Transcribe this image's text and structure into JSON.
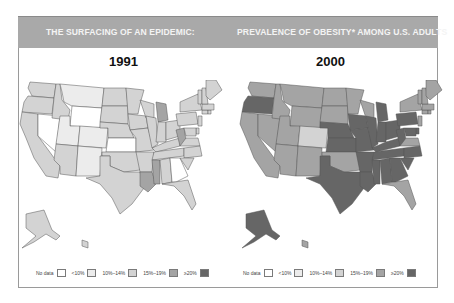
{
  "header": {
    "left_title": "THE SURFACING OF AN EPIDEMIC:",
    "right_title": "PREVALENCE OF OBESITY* AMONG U.S. ADULTS"
  },
  "colors": {
    "nodata": "#ffffff",
    "lt10": "#ececec",
    "p10_14": "#d3d3d3",
    "p15_19": "#a4a4a4",
    "ge20": "#666666"
  },
  "legend": [
    {
      "label": "No data",
      "key": "nodata"
    },
    {
      "label": "<10%",
      "key": "lt10"
    },
    {
      "label": "10%–14%",
      "key": "p10_14"
    },
    {
      "label": "15%–19%",
      "key": "p15_19"
    },
    {
      "label": "≥20%",
      "key": "ge20"
    }
  ],
  "chart_data": [
    {
      "type": "choropleth",
      "title": "1991",
      "legend": [
        "No data",
        "<10%",
        "10%–14%",
        "15%–19%",
        "≥20%"
      ],
      "states": {
        "WA": "10%–14%",
        "OR": "10%–14%",
        "CA": "10%–14%",
        "NV": "No data",
        "ID": "10%–14%",
        "MT": "<10%",
        "WY": "No data",
        "UT": "<10%",
        "CO": "<10%",
        "AZ": "10%–14%",
        "NM": "<10%",
        "ND": "10%–14%",
        "SD": "10%–14%",
        "NE": "10%–14%",
        "KS": "No data",
        "OK": "10%–14%",
        "TX": "10%–14%",
        "MN": "10%–14%",
        "IA": "10%–14%",
        "MO": "10%–14%",
        "AR": "10%–14%",
        "LA": "15%–19%",
        "WI": "10%–14%",
        "IL": "10%–14%",
        "MI": "15%–19%",
        "IN": "10%–14%",
        "OH": "10%–14%",
        "KY": "10%–14%",
        "TN": "10%–14%",
        "MS": "15%–19%",
        "AL": "10%–14%",
        "GA": "No data",
        "FL": "10%–14%",
        "WV": "15%–19%",
        "VA": "10%–14%",
        "NC": "10%–14%",
        "SC": "10%–14%",
        "PA": "10%–14%",
        "NY": "10%–14%",
        "NJ": "10%–14%",
        "DE": "10%–14%",
        "MD": "10%–14%",
        "CT": "10%–14%",
        "RI": "10%–14%",
        "MA": "10%–14%",
        "VT": "10%–14%",
        "NH": "10%–14%",
        "ME": "10%–14%",
        "AK": "10%–14%",
        "HI": "10%–14%"
      }
    },
    {
      "type": "choropleth",
      "title": "2000",
      "legend": [
        "No data",
        "<10%",
        "10%–14%",
        "15%–19%",
        "≥20%"
      ],
      "states": {
        "WA": "15%–19%",
        "OR": "≥20%",
        "CA": "15%–19%",
        "NV": "15%–19%",
        "ID": "15%–19%",
        "MT": "15%–19%",
        "WY": "15%–19%",
        "UT": "15%–19%",
        "CO": "10%–14%",
        "AZ": "15%–19%",
        "NM": "15%–19%",
        "ND": "15%–19%",
        "SD": "15%–19%",
        "NE": "≥20%",
        "KS": "≥20%",
        "OK": "15%–19%",
        "TX": "≥20%",
        "MN": "15%–19%",
        "IA": "≥20%",
        "MO": "≥20%",
        "AR": "≥20%",
        "LA": "≥20%",
        "WI": "15%–19%",
        "IL": "≥20%",
        "MI": "≥20%",
        "IN": "≥20%",
        "OH": "≥20%",
        "KY": "≥20%",
        "TN": "≥20%",
        "MS": "≥20%",
        "AL": "≥20%",
        "GA": "≥20%",
        "FL": "15%–19%",
        "WV": "≥20%",
        "VA": "15%–19%",
        "NC": "≥20%",
        "SC": "≥20%",
        "PA": "≥20%",
        "NY": "15%–19%",
        "NJ": "15%–19%",
        "DE": "≥20%",
        "MD": "≥20%",
        "CT": "15%–19%",
        "RI": "15%–19%",
        "MA": "15%–19%",
        "VT": "15%–19%",
        "NH": "15%–19%",
        "ME": "15%–19%",
        "AK": "≥20%",
        "HI": "15%–19%"
      }
    }
  ]
}
